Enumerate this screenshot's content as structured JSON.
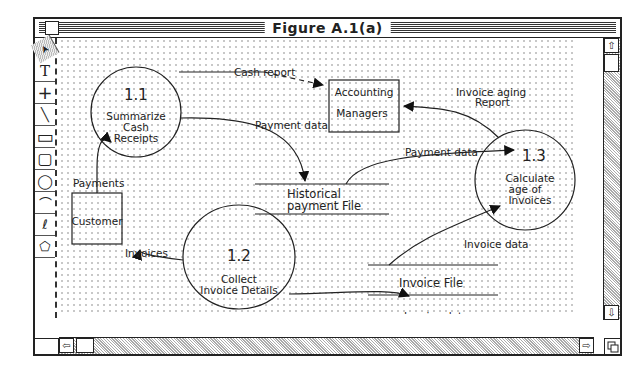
{
  "window": {
    "title": "Figure A.1(a)"
  },
  "toolbar": {
    "tools": [
      {
        "name": "arrow-tool",
        "glyph": "➤"
      },
      {
        "name": "text-tool",
        "glyph": "T"
      },
      {
        "name": "crosshair-tool",
        "glyph": "+"
      },
      {
        "name": "line-tool",
        "glyph": "╲"
      },
      {
        "name": "rectangle-tool",
        "glyph": "▭"
      },
      {
        "name": "rounded-rectangle-tool",
        "glyph": "▢"
      },
      {
        "name": "oval-tool",
        "glyph": "◯"
      },
      {
        "name": "arc-tool",
        "glyph": "⌒"
      },
      {
        "name": "freehand-tool",
        "glyph": "ℓ"
      },
      {
        "name": "polygon-tool",
        "glyph": "⬠"
      }
    ]
  },
  "diagram": {
    "processes": [
      {
        "id": "1.1",
        "lines": [
          "Summarize",
          "Cash",
          "Receipts"
        ]
      },
      {
        "id": "1.2",
        "lines": [
          "Collect",
          "Invoice Details"
        ]
      },
      {
        "id": "1.3",
        "lines": [
          "Calculate",
          "age of",
          "Invoices"
        ]
      }
    ],
    "entities": [
      {
        "label_lines": [
          "Accounting",
          "Managers"
        ]
      },
      {
        "label_lines": [
          "Customer"
        ]
      }
    ],
    "stores": [
      {
        "label_lines": [
          "Historical",
          "payment File"
        ]
      },
      {
        "label_lines": [
          "Invoice File"
        ]
      }
    ],
    "flows": {
      "cash_report": "Cash report",
      "payment_data_1": "Payment data",
      "payment_data_2": "Payment data",
      "aging_1": "Invoice aging",
      "aging_2": "Report",
      "payments": "Payments",
      "invoices": "Invoices",
      "invoice_data_1": "Invoice data",
      "invoice_data_2": "Invoice data"
    }
  },
  "scrollbars": {
    "up": "⇧",
    "down": "⇩",
    "left": "⇦",
    "right": "⇨"
  }
}
